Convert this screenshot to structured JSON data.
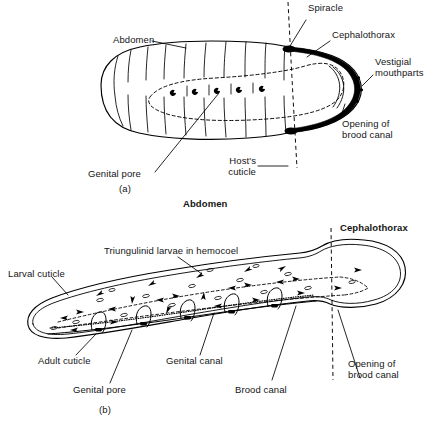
{
  "figure": {
    "title_visible": false,
    "panels": [
      {
        "id": "a",
        "caption": "(a)",
        "description": "Dorsal view of a female stylopid (Strepsiptera) embedded in host cuticle",
        "labels": [
          {
            "key": "abdomen",
            "text": "Abdomen"
          },
          {
            "key": "spiracle",
            "text": "Spiracle"
          },
          {
            "key": "cephalothorax",
            "text": "Cephalothorax"
          },
          {
            "key": "vestigial_mouthparts",
            "text": "Vestigial\nmouthparts"
          },
          {
            "key": "opening_brood_canal",
            "text": "Opening of\nbrood canal"
          },
          {
            "key": "hosts_cuticle",
            "text": "Host's\ncuticle"
          },
          {
            "key": "genital_pore",
            "text": "Genital pore"
          }
        ]
      },
      {
        "id": "b",
        "caption": "(b)",
        "description": "Sagittal section showing triungulinid larvae filling the hemocoel",
        "headings": [
          {
            "key": "abdomen",
            "text": "Abdomen"
          },
          {
            "key": "cephalothorax",
            "text": "Cephalothorax"
          }
        ],
        "labels": [
          {
            "key": "triungulinid",
            "text": "Triungulinid larvae in hemocoel"
          },
          {
            "key": "larval_cuticle",
            "text": "Larval cuticle"
          },
          {
            "key": "adult_cuticle",
            "text": "Adult cuticle"
          },
          {
            "key": "genital_pore",
            "text": "Genital pore"
          },
          {
            "key": "genital_canal",
            "text": "Genital canal"
          },
          {
            "key": "brood_canal",
            "text": "Brood canal"
          },
          {
            "key": "opening_brood_canal",
            "text": "Opening of\nbrood canal"
          }
        ]
      }
    ]
  },
  "colors": {
    "ink": "#151515",
    "background": "#ffffff",
    "fill": "#000000"
  },
  "counts": {
    "genital_pores_panel_a": 5,
    "genital_canals_panel_b": 5
  }
}
